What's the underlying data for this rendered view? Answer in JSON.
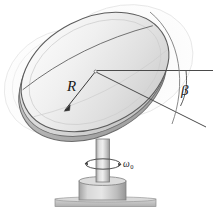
{
  "figure": {
    "background_color": "#ffffff"
  },
  "labels": {
    "radius": {
      "text": "R",
      "name": "radius-label",
      "description": "Radius of the dish, arrow points from label down-left to dish rim"
    },
    "tilt_angle": {
      "text": "β",
      "name": "tilt-angle-label",
      "description": "Angle between horizontal reference line and dish plane line"
    },
    "spin_rate": {
      "text": "ω",
      "subscript": "0",
      "name": "spin-rate-label",
      "description": "Angular velocity of pedestal about vertical axis"
    }
  },
  "colors": {
    "outline": "#555555",
    "dish_light": "#f4f4f4",
    "dish_mid": "#dcdcdc",
    "dish_dark": "#b9b9b9",
    "rim_shadow": "#a8a8a8",
    "ghost": "#efefef",
    "ghost_outline": "#d6d6d6",
    "pedestal_light": "#e2e2e2",
    "pedestal_mid": "#bfbfbf",
    "pedestal_dark": "#9a9a9a",
    "ground": "#c6c6c6",
    "leader_line": "#4a4a4a",
    "text": "#1a1a1a"
  },
  "geometry": {
    "dish_center": {
      "x": 95,
      "y": 72
    },
    "dish_radius_label_point": {
      "x": 73,
      "y": 88
    },
    "horizontal_line": {
      "x1": 97,
      "y1": 71,
      "x2": 212,
      "y2": 71
    },
    "tilt_line": {
      "x1": 97,
      "y1": 73,
      "x2": 205,
      "y2": 127
    },
    "column": {
      "x": 96,
      "y_top": 140,
      "y_bottom": 180,
      "width": 13
    },
    "base_block": {
      "x": 79,
      "y": 180,
      "width": 47,
      "height": 20
    },
    "ground_plate": {
      "x": 55,
      "y": 199,
      "width": 101,
      "height": 8
    }
  }
}
